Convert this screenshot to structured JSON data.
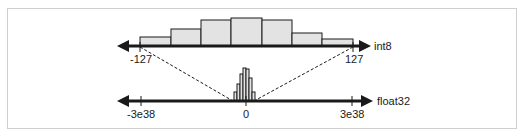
{
  "diagram": {
    "title": "",
    "top_axis": {
      "name": "int8",
      "min_label": "-127",
      "max_label": "127",
      "histogram_bins": [
        {
          "x": 140,
          "w": 31,
          "top": 37
        },
        {
          "x": 171,
          "w": 30,
          "top": 29
        },
        {
          "x": 201,
          "w": 30,
          "top": 20
        },
        {
          "x": 231,
          "w": 31,
          "top": 18
        },
        {
          "x": 262,
          "w": 30,
          "top": 20
        },
        {
          "x": 292,
          "w": 30,
          "top": 33
        },
        {
          "x": 322,
          "w": 31,
          "top": 39
        }
      ]
    },
    "bottom_axis": {
      "name": "float32",
      "min_label": "-3e38",
      "zero_label": "0",
      "max_label": "3e38",
      "histogram_bins": [
        {
          "x": 234,
          "w": 3,
          "top": 92
        },
        {
          "x": 237,
          "w": 3,
          "top": 84
        },
        {
          "x": 240,
          "w": 3,
          "top": 74
        },
        {
          "x": 243,
          "w": 3,
          "top": 68
        },
        {
          "x": 246,
          "w": 3,
          "top": 69
        },
        {
          "x": 249,
          "w": 3,
          "top": 78
        },
        {
          "x": 252,
          "w": 3,
          "top": 92
        }
      ]
    },
    "mapping_note": "dashed lines map float32 range near 0 to int8 range -127..127",
    "colors": {
      "bar_fill": "#e3e3e3",
      "stroke": "#1a1a1a",
      "frame": "#cfcfcf"
    }
  }
}
